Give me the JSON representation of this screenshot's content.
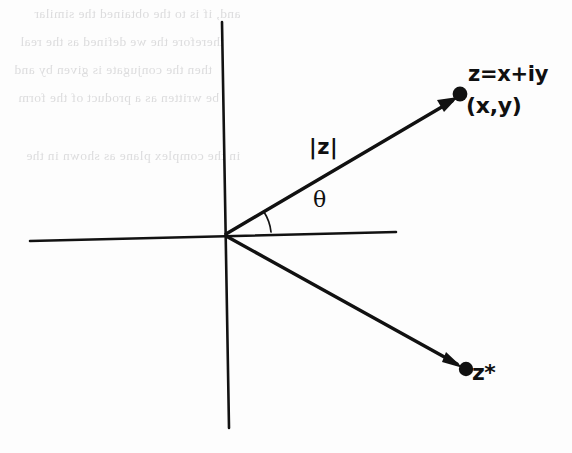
{
  "figure": {
    "name": "argand-diagram",
    "width": 572,
    "height": 453,
    "background_color": "#fdfdfd",
    "ink_color": "#101010",
    "ghost_text_color": "#c9c9cb"
  },
  "labels": {
    "z_expression": "z=x+iy",
    "z_coordinates": "(x,y)",
    "modulus": "|z|",
    "angle": "θ",
    "conjugate": "z*"
  },
  "axes": {
    "horizontal": {
      "x1": 30,
      "y1": 241,
      "x2": 396,
      "y2": 232
    },
    "vertical": {
      "x1": 222,
      "y1": 22,
      "x2": 229,
      "y2": 428
    },
    "origin": {
      "x": 225,
      "y": 235
    }
  },
  "vectors": [
    {
      "name": "z-vector",
      "label": "z=x+iy",
      "from": {
        "x": 226,
        "y": 234
      },
      "to": {
        "x": 458,
        "y": 97
      },
      "endpoint_marker": "filled-dot",
      "arrowhead": true
    },
    {
      "name": "z-conjugate-vector",
      "label": "z*",
      "from": {
        "x": 226,
        "y": 236
      },
      "to": {
        "x": 463,
        "y": 368
      },
      "endpoint_marker": "filled-dot",
      "arrowhead": true
    }
  ],
  "angle_arc": {
    "name": "theta-arc",
    "center": {
      "x": 226,
      "y": 235
    },
    "radius": 45,
    "start_deg": 0,
    "end_deg": 30
  },
  "ghost_text": {
    "note": "faint bleed-through text from reverse of scanned page; mirrored and illegible",
    "lines": [
      {
        "top": 6,
        "left": 34,
        "text": "and, if  is  to  the  obtained  the  similar"
      },
      {
        "top": 34,
        "left": 20,
        "text": "therefore  the  we  defined  as  the  real"
      },
      {
        "top": 62,
        "left": 14,
        "text": "then  the  conjugate  is  given  by  and"
      },
      {
        "top": 90,
        "left": 18,
        "text": "be  written  as  a  product  of  the  form"
      },
      {
        "top": 148,
        "left": 26,
        "text": "in  the  complex  plane  as  shown  in  the"
      }
    ]
  }
}
